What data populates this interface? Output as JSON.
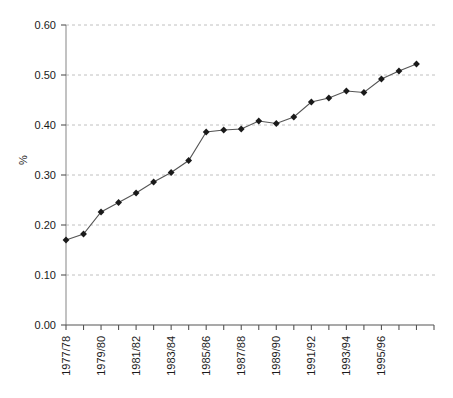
{
  "chart_data": {
    "type": "line",
    "title": "",
    "xlabel": "",
    "ylabel": "%",
    "ylim": [
      0.0,
      0.6
    ],
    "ytick_values": [
      0.0,
      0.1,
      0.2,
      0.3,
      0.4,
      0.5,
      0.6
    ],
    "ytick_labels": [
      "0.00",
      "0.10",
      "0.20",
      "0.30",
      "0.40",
      "0.50",
      "0.60"
    ],
    "grid": true,
    "grid_style": "dashed-horizontal",
    "legend": "none",
    "marker": "diamond",
    "marker_color": "#1a1a1a",
    "line_color": "#555555",
    "categories": [
      "1977/78",
      "1978/79",
      "1979/80",
      "1980/81",
      "1981/82",
      "1982/83",
      "1983/84",
      "1984/85",
      "1985/86",
      "1986/87",
      "1987/88",
      "1988/89",
      "1989/90",
      "1990/91",
      "1991/92",
      "1992/93",
      "1993/94",
      "1994/95",
      "1995/96",
      "1996/97",
      "1997/98"
    ],
    "xtick_labels_shown": [
      "1977/78",
      "1979/80",
      "1981/82",
      "1983/84",
      "1985/86",
      "1987/88",
      "1989/90",
      "1991/92",
      "1993/94",
      "1995/96"
    ],
    "xtick_label_interval": 2,
    "xtick_label_rotation": -90,
    "values": [
      0.17,
      0.182,
      0.226,
      0.245,
      0.264,
      0.286,
      0.305,
      0.329,
      0.386,
      0.39,
      0.392,
      0.408,
      0.403,
      0.416,
      0.446,
      0.454,
      0.468,
      0.465,
      0.492,
      0.508,
      0.522
    ]
  },
  "axes": {
    "y_axis_label": "%"
  }
}
